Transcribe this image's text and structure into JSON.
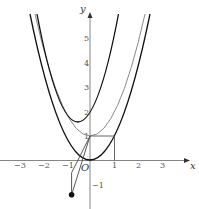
{
  "diagram": {
    "type": "function-graph",
    "axes": {
      "x_label": "x",
      "y_label": "y",
      "origin_label": "O",
      "x_ticks": [
        "−3",
        "−2",
        "−1",
        "1",
        "2",
        "3"
      ],
      "y_ticks": [
        "1",
        "2",
        "3",
        "4",
        "5",
        "−1"
      ]
    },
    "curves": [
      {
        "name": "parabola-y-x2",
        "expr": "y = x^2",
        "color": "#111111"
      },
      {
        "name": "parabola-y-x2-plus-1",
        "expr": "y = x^2 + 1",
        "color": "#888888"
      },
      {
        "name": "parabola-shifted",
        "expr": "y = 2(x+0.5)^2 + 0.5",
        "color": "#111111"
      }
    ],
    "points": [
      {
        "name": "point-P",
        "x": -0.75,
        "y": -1.4
      }
    ],
    "colors": {
      "axis": "#333333",
      "dark_curve": "#111111",
      "light_curve": "#888888"
    }
  }
}
